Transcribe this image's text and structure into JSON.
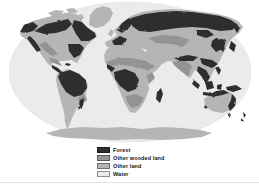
{
  "colors": {
    "background": "#ffffff",
    "water": "#ebebeb",
    "other_land": "#b5b5b5",
    "other_wooded_land": "#949494",
    "forest": "#2e2e2e",
    "legend_text": "#161616"
  },
  "legend": {
    "items": [
      {
        "label": "Forest",
        "color_key": "forest"
      },
      {
        "label": "Other wooded land",
        "color_key": "other_wooded_land"
      },
      {
        "label": "Other land",
        "color_key": "other_land"
      },
      {
        "label": "Water",
        "color_key": "water"
      }
    ]
  }
}
